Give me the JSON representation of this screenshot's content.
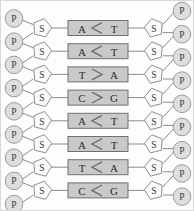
{
  "diagram": {
    "type": "dna-ladder",
    "background_color": "#fdfdfd",
    "border_color": "#d8d8d8",
    "colors": {
      "phosphate_fill": "#dedede",
      "phosphate_stroke": "#9a9a9a",
      "sugar_fill": "#fbfbfb",
      "sugar_stroke": "#8f8f8f",
      "pair_box_fill": "#c9c9c9",
      "pair_box_stroke": "#707070",
      "connector_stroke": "#8c8c8c",
      "bond_stroke": "#6e6e6e",
      "text_color": "#2b2b2b"
    },
    "labels": {
      "phosphate": "P",
      "sugar": "S"
    },
    "counts": {
      "base_pairs": 8,
      "phosphates_per_strand": 9,
      "sugars_per_strand": 8
    }
  },
  "base_pairs": [
    {
      "index": 1,
      "left_base": "A",
      "right_base": "T",
      "bond_marker": "<"
    },
    {
      "index": 2,
      "left_base": "A",
      "right_base": "T",
      "bond_marker": "<"
    },
    {
      "index": 3,
      "left_base": "T",
      "right_base": "A",
      "bond_marker": ">"
    },
    {
      "index": 4,
      "left_base": "C",
      "right_base": "G",
      "bond_marker": ">"
    },
    {
      "index": 5,
      "left_base": "A",
      "right_base": "T",
      "bond_marker": "<"
    },
    {
      "index": 6,
      "left_base": "A",
      "right_base": "T",
      "bond_marker": "<"
    },
    {
      "index": 7,
      "left_base": "T",
      "right_base": "A",
      "bond_marker": "<"
    },
    {
      "index": 8,
      "left_base": "C",
      "right_base": "G",
      "bond_marker": "<"
    }
  ],
  "left_strand": {
    "phosphates": [
      "P",
      "P",
      "P",
      "P",
      "P",
      "P",
      "P",
      "P",
      "P"
    ],
    "sugars": [
      "S",
      "S",
      "S",
      "S",
      "S",
      "S",
      "S",
      "S"
    ]
  },
  "right_strand": {
    "phosphates": [
      "P",
      "P",
      "P",
      "P",
      "P",
      "P",
      "P",
      "P",
      "P"
    ],
    "sugars": [
      "S",
      "S",
      "S",
      "S",
      "S",
      "S",
      "S",
      "S"
    ]
  }
}
